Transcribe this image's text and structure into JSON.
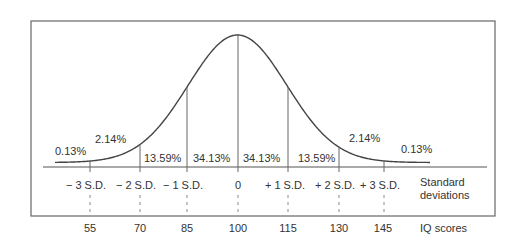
{
  "chart_data": {
    "type": "line",
    "title": "",
    "mean": 100,
    "sd": 15,
    "standard_deviation_labels": [
      "− 3 S.D.",
      "− 2 S.D.",
      "− 1 S.D.",
      "0",
      "+ 1 S.D.",
      "+ 2 S.D.",
      "+ 3 S.D."
    ],
    "iq_scores": [
      "55",
      "70",
      "85",
      "100",
      "115",
      "130",
      "145"
    ],
    "band_percentages": [
      {
        "band": "below -3 SD",
        "label": "0.13%"
      },
      {
        "band": "-3 to -2 SD",
        "label": "2.14%"
      },
      {
        "band": "-2 to -1 SD",
        "label": "13.59%"
      },
      {
        "band": "-1 to 0 SD",
        "label": "34.13%"
      },
      {
        "band": "0 to +1 SD",
        "label": "34.13%"
      },
      {
        "band": "+1 to +2 SD",
        "label": "13.59%"
      },
      {
        "band": "+2 to +3 SD",
        "label": "2.14%"
      },
      {
        "band": "above +3 SD",
        "label": "0.13%"
      }
    ],
    "row_labels": {
      "sd_row_line1": "Standard",
      "sd_row_line2": "deviations",
      "iq_row": "IQ scores"
    },
    "xlabel": "IQ scores",
    "ylabel": "",
    "grid": false,
    "legend": "none"
  },
  "colors": {
    "line": "#555555",
    "text": "#333333",
    "background": "#ffffff"
  }
}
